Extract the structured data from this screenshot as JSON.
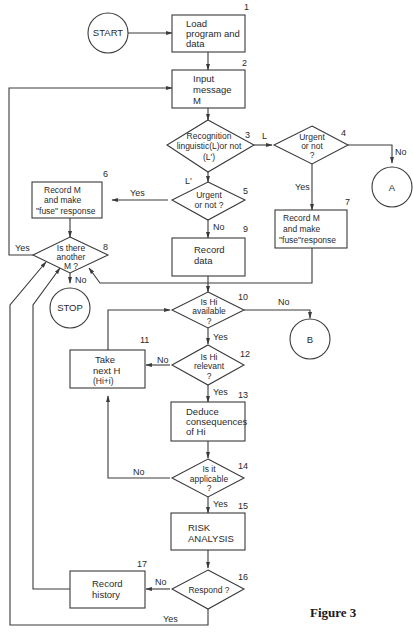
{
  "figure": {
    "caption": "Figure 3"
  },
  "nodes": {
    "start": {
      "label": "START"
    },
    "n1": {
      "number": "1",
      "lines": [
        "Load",
        "program and",
        "data"
      ]
    },
    "n2": {
      "number": "2",
      "lines": [
        "Input",
        "message",
        "M"
      ]
    },
    "n3": {
      "number": "3",
      "lines": [
        "Recognition",
        "linguistic(L)or not",
        "(L')"
      ]
    },
    "n4": {
      "number": "4",
      "lines": [
        "Urgent",
        "or not",
        "?"
      ]
    },
    "n5": {
      "number": "5",
      "lines": [
        "Urgent",
        "or not ?"
      ]
    },
    "n6": {
      "number": "6",
      "lines": [
        "Record M",
        "and make",
        "\"fuse\" response"
      ]
    },
    "n7": {
      "number": "7",
      "lines": [
        "Record M",
        "and make",
        "\"fuse\"response"
      ]
    },
    "n8": {
      "number": "8",
      "lines": [
        "Is there",
        "another",
        "M ?"
      ]
    },
    "n9": {
      "number": "9",
      "lines": [
        "Record",
        "data"
      ]
    },
    "n10": {
      "number": "10",
      "lines": [
        "Is Hi",
        "available",
        "?"
      ]
    },
    "n11": {
      "number": "11",
      "lines": [
        "Take",
        "next H",
        "(Hi+i)"
      ]
    },
    "n12": {
      "number": "12",
      "lines": [
        "Is Hi",
        "relevant",
        "?"
      ]
    },
    "n13": {
      "number": "13",
      "lines": [
        "Deduce",
        "consequences",
        "of Hi"
      ]
    },
    "n14": {
      "number": "14",
      "lines": [
        "Is it",
        "applicable",
        "?"
      ]
    },
    "n15": {
      "number": "15",
      "lines": [
        "RISK",
        "ANALYSIS"
      ]
    },
    "n16": {
      "number": "16",
      "lines": [
        "Respond ?"
      ]
    },
    "n17": {
      "number": "17",
      "lines": [
        "Record",
        "history"
      ]
    },
    "stop": {
      "label": "STOP"
    },
    "A": {
      "label": "A"
    },
    "B": {
      "label": "B"
    }
  },
  "edge_labels": {
    "n3_to_n4": "L",
    "n3_to_n5": "L'",
    "n4_no": "No",
    "n4_yes": "Yes",
    "n5_yes": "Yes",
    "n5_no": "No",
    "n8_yes": "Yes",
    "n8_no": "No",
    "n10_no": "No",
    "n10_yes": "Yes",
    "n12_no": "No",
    "n12_yes": "Yes",
    "n14_no": "No",
    "n14_yes": "Yes",
    "n16_no": "No",
    "n16_yes": "Yes"
  }
}
